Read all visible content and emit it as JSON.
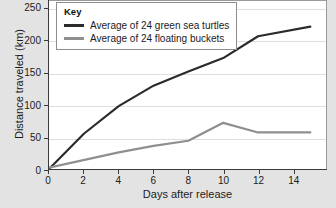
{
  "chart_data": {
    "type": "line",
    "title": "",
    "xlabel": "Days after release",
    "ylabel": "Distance traveled (km)",
    "xlim": [
      0,
      15.9
    ],
    "ylim": [
      0,
      262
    ],
    "xticks": [
      0,
      2,
      4,
      6,
      8,
      10,
      12,
      14
    ],
    "yticks": [
      0,
      50,
      100,
      150,
      200,
      250
    ],
    "grid": "horizontal",
    "legend_position": "top-left",
    "legend_title": "Key",
    "series": [
      {
        "name": "Average of 24 green sea turtles",
        "color": "#2b2b2b",
        "x": [
          0,
          2,
          4,
          6,
          8,
          10,
          12,
          15
        ],
        "values": [
          0,
          55,
          98,
          130,
          152,
          173,
          207,
          222
        ]
      },
      {
        "name": "Average of 24 floating buckets",
        "color": "#8f8f8f",
        "x": [
          0,
          4,
          6,
          8,
          10,
          12,
          15
        ],
        "values": [
          2,
          26,
          36,
          44,
          72,
          57,
          57
        ]
      }
    ]
  },
  "legend": {
    "title": "Key",
    "entries": [
      {
        "label": "Average of 24 green sea turtles",
        "color": "#2b2b2b"
      },
      {
        "label": "Average of 24 floating buckets",
        "color": "#8f8f8f"
      }
    ]
  },
  "axes": {
    "x_title": "Days after release",
    "y_title": "Distance traveled (km)",
    "x_tick_labels": [
      "0",
      "2",
      "4",
      "6",
      "8",
      "10",
      "12",
      "14"
    ],
    "y_tick_labels": [
      "0",
      "50",
      "100",
      "150",
      "200",
      "250"
    ]
  },
  "colors": {
    "background": "#e3e3e3",
    "plot_background": "#ffffff",
    "gridline": "#dedede",
    "axis": "#3a3a3a",
    "series_dark": "#2b2b2b",
    "series_gray": "#8f8f8f"
  }
}
